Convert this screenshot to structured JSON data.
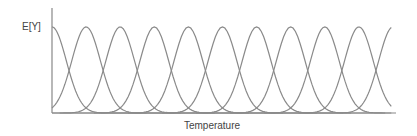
{
  "chart_data": {
    "type": "line",
    "title": "",
    "xlabel": "Temperature",
    "ylabel": "E[Y]",
    "xlim": [
      0,
      10
    ],
    "ylim": [
      0,
      1
    ],
    "grid": false,
    "legend": "none",
    "x_ticks": [],
    "y_ticks": [],
    "series": [
      {
        "name": "curve-1",
        "peak_x": 0,
        "peak_y": 0.82
      },
      {
        "name": "curve-2",
        "peak_x": 1,
        "peak_y": 0.82
      },
      {
        "name": "curve-3",
        "peak_x": 2,
        "peak_y": 0.82
      },
      {
        "name": "curve-4",
        "peak_x": 3,
        "peak_y": 0.82
      },
      {
        "name": "curve-5",
        "peak_x": 4,
        "peak_y": 0.82
      },
      {
        "name": "curve-6",
        "peak_x": 5,
        "peak_y": 0.82
      },
      {
        "name": "curve-7",
        "peak_x": 6,
        "peak_y": 0.82
      },
      {
        "name": "curve-8",
        "peak_x": 7,
        "peak_y": 0.82
      },
      {
        "name": "curve-9",
        "peak_x": 8,
        "peak_y": 0.82
      },
      {
        "name": "curve-10",
        "peak_x": 9,
        "peak_y": 0.82
      },
      {
        "name": "curve-11",
        "peak_x": 10,
        "peak_y": 0.82
      }
    ],
    "curve_sigma": 0.42,
    "x_visible_max": 9.95
  }
}
